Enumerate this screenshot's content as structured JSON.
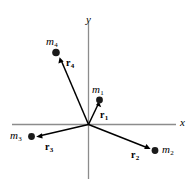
{
  "figure": {
    "type": "vector-diagram",
    "background_color": "#ffffff",
    "axis_color": "#808080",
    "vector_color": "#000000",
    "mass_color": "#1a1a1a",
    "axes": {
      "x_label": "x",
      "y_label": "y",
      "origin_label": ""
    },
    "masses": [
      {
        "id": "m1",
        "label": "m",
        "subscript": "1"
      },
      {
        "id": "m2",
        "label": "m",
        "subscript": "2"
      },
      {
        "id": "m3",
        "label": "m",
        "subscript": "3"
      },
      {
        "id": "m4",
        "label": "m",
        "subscript": "4"
      }
    ],
    "vectors": [
      {
        "id": "r1",
        "label": "r",
        "subscript": "1"
      },
      {
        "id": "r2",
        "label": "r",
        "subscript": "2"
      },
      {
        "id": "r3",
        "label": "r",
        "subscript": "3"
      },
      {
        "id": "r4",
        "label": "r",
        "subscript": "4"
      }
    ]
  }
}
